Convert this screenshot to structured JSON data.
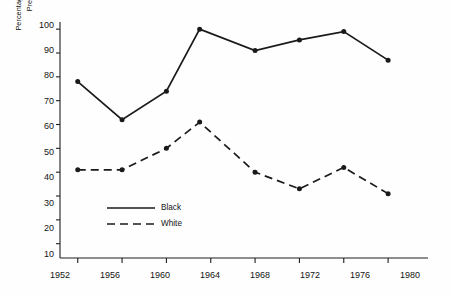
{
  "chart_data": {
    "type": "line",
    "title": "",
    "xlabel": "",
    "ylabel": "Percentage of Vote for Democratic\nPresidential Candidate",
    "x": [
      1952,
      1956,
      1960,
      1963,
      1968,
      1972,
      1976,
      1980
    ],
    "xtick_labels": [
      "1952",
      "1956",
      "1960",
      "1964",
      "1968",
      "1972",
      "1976",
      "1980"
    ],
    "xticks": [
      1952,
      1956,
      1960,
      1964,
      1968,
      1972,
      1976,
      1980
    ],
    "ytick_labels": [
      "10",
      "20",
      "30",
      "40",
      "50",
      "60",
      "70",
      "80",
      "90",
      "100"
    ],
    "yticks": [
      10,
      20,
      30,
      40,
      50,
      60,
      70,
      80,
      90,
      100
    ],
    "xlim": [
      1950.4,
      1983.6
    ],
    "ylim": [
      4,
      103
    ],
    "grid": false,
    "legend_position": "inside-lower-left",
    "series": [
      {
        "name": "Black",
        "style": "solid",
        "color": "#1a1a1a",
        "marker": "circle",
        "x": [
          1952,
          1956,
          1960,
          1963,
          1968,
          1972,
          1976,
          1980
        ],
        "values": [
          78,
          62,
          74,
          100,
          91,
          95.5,
          99,
          87
        ]
      },
      {
        "name": "White",
        "style": "dashed",
        "color": "#1a1a1a",
        "marker": "circle",
        "x": [
          1952,
          1956,
          1960,
          1963,
          1968,
          1972,
          1976,
          1980
        ],
        "values": [
          41,
          41,
          50,
          61,
          40,
          33,
          42,
          31
        ]
      }
    ],
    "legend": [
      {
        "label": "Black",
        "style": "solid"
      },
      {
        "label": "White",
        "style": "dashed"
      }
    ]
  },
  "axis": {
    "ytick_1": "10",
    "ytick_2": "20",
    "ytick_3": "30",
    "ytick_4": "40",
    "ytick_5": "50",
    "ytick_6": "60",
    "ytick_7": "70",
    "ytick_8": "80",
    "ytick_9": "90",
    "ytick_10": "100",
    "xtick_1": "1952",
    "xtick_2": "1956",
    "xtick_3": "1960",
    "xtick_4": "1964",
    "xtick_5": "1968",
    "xtick_6": "1972",
    "xtick_7": "1976",
    "xtick_8": "1980"
  },
  "legend": {
    "black_label": "Black",
    "white_label": "White"
  },
  "ylabel_text": "Percentage of Vote for Democratic\nPresidential Candidate"
}
